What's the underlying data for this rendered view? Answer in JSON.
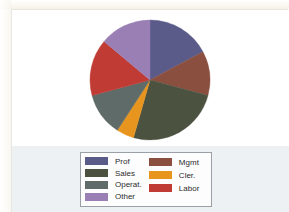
{
  "document": {
    "background_color": "#ffffff",
    "legend_band_color": "#eef1f3",
    "frame_border_color": "#e9e6dd"
  },
  "legend": {
    "border_color": "#9aa0a6",
    "background_color": "#fdfdfd",
    "left_column": [
      {
        "label": "Prof",
        "color": "#5b5b8a"
      },
      {
        "label": "Sales",
        "color": "#4b5340"
      },
      {
        "label": "Operat.",
        "color": "#5f6b68"
      },
      {
        "label": "Other",
        "color": "#9a7fb5"
      }
    ],
    "right_column": [
      {
        "label": "Mgmt",
        "color": "#8a4f3f"
      },
      {
        "label": "Cler.",
        "color": "#e8951f"
      },
      {
        "label": "Labor",
        "color": "#bf3b33"
      }
    ]
  },
  "chart_data": {
    "type": "pie",
    "title": "",
    "legend_position": "bottom",
    "start_angle_deg": 0,
    "direction": "clockwise",
    "center": {
      "x": 61,
      "y": 61
    },
    "radius": 60,
    "categories": [
      "Prof",
      "Mgmt",
      "Sales",
      "Cler.",
      "Operat.",
      "Labor",
      "Other"
    ],
    "values": [
      17.2,
      11.9,
      25.3,
      4.7,
      11.7,
      15.3,
      13.9
    ],
    "angles_deg": [
      62,
      43,
      91,
      17,
      42,
      55,
      50
    ],
    "colors": [
      "#5b5b8a",
      "#8a4f3f",
      "#4b5340",
      "#e8951f",
      "#5f6b68",
      "#bf3b33",
      "#9a7fb5"
    ],
    "slices": [
      {
        "name": "Prof",
        "color": "#5b5b8a",
        "start_deg": 0,
        "end_deg": 62,
        "value": 17.2
      },
      {
        "name": "Mgmt",
        "color": "#8a4f3f",
        "start_deg": 62,
        "end_deg": 105,
        "value": 11.9
      },
      {
        "name": "Sales",
        "color": "#4b5340",
        "start_deg": 105,
        "end_deg": 196,
        "value": 25.3
      },
      {
        "name": "Cler.",
        "color": "#e8951f",
        "start_deg": 196,
        "end_deg": 213,
        "value": 4.7
      },
      {
        "name": "Operat.",
        "color": "#5f6b68",
        "start_deg": 213,
        "end_deg": 255,
        "value": 11.7
      },
      {
        "name": "Labor",
        "color": "#bf3b33",
        "start_deg": 255,
        "end_deg": 310,
        "value": 15.3
      },
      {
        "name": "Other",
        "color": "#9a7fb5",
        "start_deg": 310,
        "end_deg": 360,
        "value": 13.9
      }
    ],
    "xlabel": "",
    "ylabel": ""
  }
}
